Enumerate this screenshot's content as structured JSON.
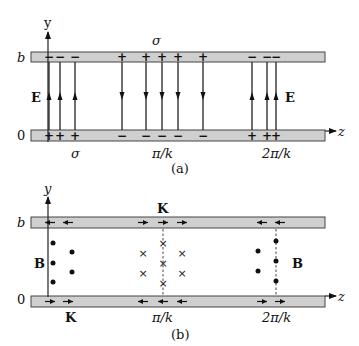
{
  "figure_a": {
    "caption": "(a)",
    "y_axis_label": "y",
    "z_axis_label": "z",
    "top_level_label": "b",
    "bottom_level_label": "0",
    "field_label": "E",
    "sigma_top_label": "σ",
    "sigma_bottom_label": "σ",
    "tick_labels": [
      "π/k",
      "2π/k"
    ],
    "field_groups": [
      {
        "direction": "up",
        "top_charge": "−",
        "bottom_charge": "+",
        "count": 3
      },
      {
        "direction": "down",
        "top_charge": "+",
        "bottom_charge": "−",
        "count": 5
      },
      {
        "direction": "up",
        "top_charge": "−",
        "bottom_charge": "+",
        "count": 3
      }
    ]
  },
  "figure_b": {
    "caption": "(b)",
    "y_axis_label": "y",
    "z_axis_label": "z",
    "top_level_label": "b",
    "bottom_level_label": "0",
    "field_label": "B",
    "current_label_top": "K",
    "current_label_bottom": "K",
    "tick_labels": [
      "π/k",
      "2π/k"
    ],
    "field_symbols": {
      "out_of_page": "•",
      "into_page": "×"
    },
    "current_groups": [
      {
        "top_direction": "left",
        "bottom_direction": "right",
        "count": 2
      },
      {
        "top_direction": "right",
        "bottom_direction": "left",
        "count": 3
      },
      {
        "top_direction": "left",
        "bottom_direction": "right",
        "count": 2
      }
    ]
  }
}
